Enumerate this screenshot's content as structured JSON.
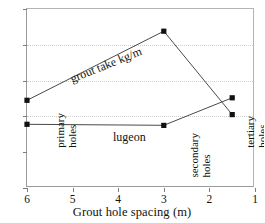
{
  "chart_data": {
    "type": "line",
    "title": "",
    "xlabel": "Grout hole spacing (m)",
    "ylabel": "",
    "xlim": [
      6,
      1
    ],
    "ylim": [
      0,
      50
    ],
    "x_reversed": true,
    "grid": "horizontal dotted at 20, 30, 40",
    "legend": "inline labels on curves",
    "xticks": [
      6,
      5,
      4,
      3,
      2,
      1
    ],
    "yticks": [
      0,
      10,
      20,
      30,
      40,
      50
    ],
    "x": [
      6,
      3,
      1.5
    ],
    "categories": [
      "primary holes",
      "secondary holes",
      "tertiary holes"
    ],
    "series": [
      {
        "name": "grout take kg/m",
        "label": "grout take kg/m",
        "values": [
          24.5,
          43.8,
          20.5
        ],
        "marker": "filled square"
      },
      {
        "name": "lugeon",
        "label": "lugeon",
        "values": [
          17.8,
          17.5,
          25.2
        ],
        "marker": "filled square"
      }
    ],
    "annotations": [
      {
        "text": "grout take kg/m",
        "at": [
          4.5,
          32
        ]
      },
      {
        "text": "lugeon",
        "at": [
          4.2,
          15.5
        ]
      }
    ]
  },
  "axes": {
    "x": {
      "title": "Grout hole spacing (m)",
      "ticks": [
        "6",
        "5",
        "4",
        "3",
        "2",
        "1"
      ],
      "values": [
        6,
        5,
        4,
        3,
        2,
        1
      ]
    },
    "y": {
      "title": "",
      "ticks": [
        "50",
        "40",
        "30",
        "20",
        "10",
        "0"
      ],
      "values": [
        50,
        40,
        30,
        20,
        10,
        0
      ]
    }
  },
  "annotations": {
    "grout_take": "grout take kg/m",
    "lugeon": "lugeon"
  },
  "hole_groups": [
    {
      "line1": "primary",
      "line2": "holes",
      "x": 6
    },
    {
      "line1": "secondary",
      "line2": "holes",
      "x": 3
    },
    {
      "line1": "tertiary",
      "line2": "holes",
      "x": 1.5
    }
  ],
  "colors": {
    "line": "#4a4a4a",
    "marker": "#111111",
    "grid": "#cfcfcf",
    "axis": "#9a9a9a",
    "text": "#111111",
    "background": "#ffffff"
  }
}
